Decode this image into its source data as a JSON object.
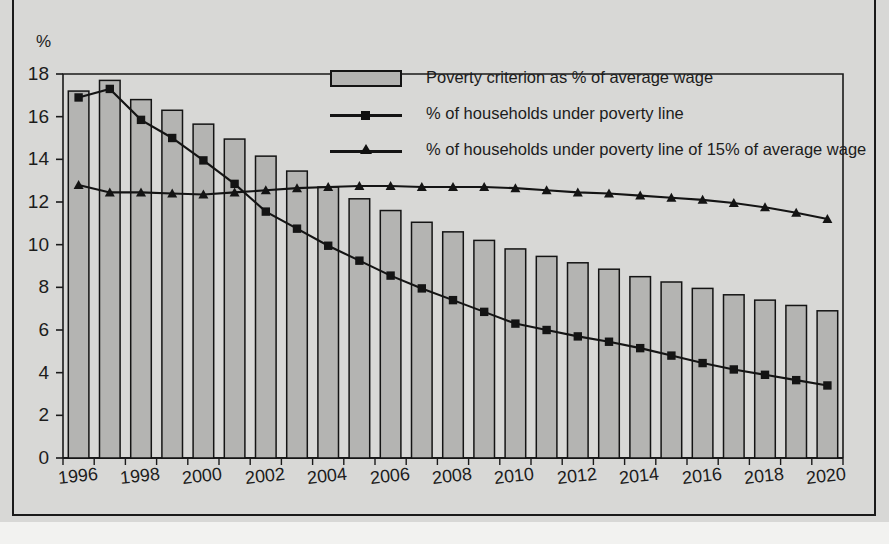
{
  "page": {
    "background_color": "#d8d8d6",
    "frame_color": "#1a1a1a",
    "title_fragment": ""
  },
  "chart_data": {
    "type": "bar",
    "title": "",
    "xlabel": "",
    "ylabel": "%",
    "ylim": [
      0,
      18
    ],
    "ytick_step": 2,
    "grid": false,
    "legend_position": "top-right-inside",
    "x": [
      1996,
      1997,
      1998,
      1999,
      2000,
      2001,
      2002,
      2003,
      2004,
      2005,
      2006,
      2007,
      2008,
      2009,
      2010,
      2011,
      2012,
      2013,
      2014,
      2015,
      2016,
      2017,
      2018,
      2019,
      2020
    ],
    "xtick_labels": [
      "1996",
      "1998",
      "2000",
      "2002",
      "2004",
      "2006",
      "2008",
      "2010",
      "2012",
      "2014",
      "2016",
      "2018",
      "2020"
    ],
    "ytick_labels": [
      "0",
      "2",
      "4",
      "6",
      "8",
      "10",
      "12",
      "14",
      "16",
      "18"
    ],
    "series": [
      {
        "name": "Poverty criterion as % of average wage",
        "kind": "bar",
        "marker": "none",
        "color": "#b4b4b2",
        "edge_color": "#141414",
        "values": [
          17.2,
          17.7,
          16.8,
          16.3,
          15.65,
          14.95,
          14.15,
          13.45,
          12.7,
          12.15,
          11.6,
          11.05,
          10.6,
          10.2,
          9.8,
          9.45,
          9.15,
          8.85,
          8.5,
          8.25,
          7.95,
          7.65,
          7.4,
          7.15,
          6.9
        ]
      },
      {
        "name": "% of households under poverty line",
        "kind": "line",
        "marker": "square",
        "color": "#141414",
        "values": [
          16.9,
          17.3,
          15.85,
          15.0,
          13.95,
          12.85,
          11.55,
          10.75,
          9.95,
          9.25,
          8.55,
          7.95,
          7.4,
          6.85,
          6.3,
          6.0,
          5.7,
          5.45,
          5.15,
          4.8,
          4.45,
          4.15,
          3.9,
          3.65,
          3.4
        ]
      },
      {
        "name": "% of households under poverty line of 15% of average wage",
        "kind": "line",
        "marker": "triangle",
        "color": "#141414",
        "values": [
          12.8,
          12.45,
          12.45,
          12.4,
          12.35,
          12.45,
          12.55,
          12.65,
          12.7,
          12.75,
          12.75,
          12.7,
          12.7,
          12.7,
          12.65,
          12.55,
          12.45,
          12.4,
          12.3,
          12.2,
          12.1,
          11.95,
          11.75,
          11.5,
          11.2
        ]
      }
    ]
  },
  "legend": {
    "items": [
      {
        "label": "Poverty criterion as % of average wage",
        "glyph": "bar-swatch"
      },
      {
        "label": "% of households under poverty line",
        "glyph": "line-square-marker"
      },
      {
        "label": "% of households under poverty line of 15% of average wage",
        "glyph": "line-triangle-marker"
      }
    ]
  },
  "axes": {
    "y_axis_title": "%"
  }
}
